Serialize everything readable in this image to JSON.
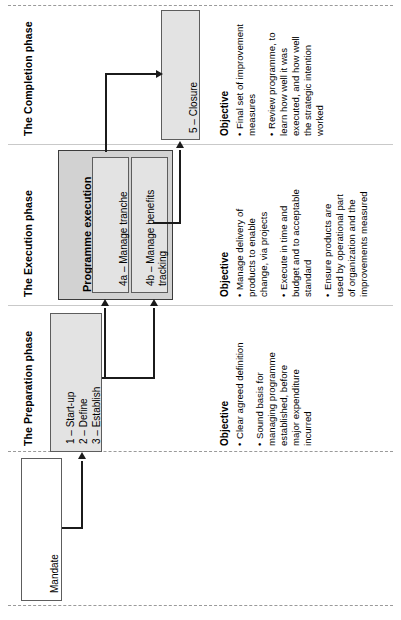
{
  "diagram": {
    "orientation": "rotated-90-ccw",
    "colors": {
      "box_fill_light": "#e3e3e3",
      "box_fill_dark": "#d2d2d2",
      "box_border": "#5d5d5d",
      "line": "#1b1b1b",
      "divider": "#9a9a9a",
      "background": "#ffffff"
    }
  },
  "phases": {
    "completion": {
      "label": "The Completion phase",
      "objective_title": "Objective",
      "objective_items": [
        "Final set of improvement measures",
        "Review programme, to learn how well it was executed, and how well the strategic intention worked"
      ],
      "objective_items_lines": [
        [
          "Final set of improvement",
          "measures"
        ],
        [
          "Review programme, to",
          "learn how well it was",
          "executed, and how well",
          "the strategic intention",
          "worked"
        ]
      ]
    },
    "execution": {
      "label": "The Execution phase",
      "objective_title": "Objective",
      "objective_items": [
        "Manage delivery of products to enable change, via projects",
        "Execute in time and budget and to acceptable standard",
        "Ensure products are used by operational part of organization and the improvements measured"
      ],
      "objective_items_lines": [
        [
          "Manage delivery of",
          "products to enable",
          "change, via projects"
        ],
        [
          "Execute in time and",
          "budget and to acceptable",
          "standard"
        ],
        [
          "Ensure products are",
          "used by operational part",
          "of organization and the",
          "improvements measured"
        ]
      ]
    },
    "preparation": {
      "label": "The Preparation phase",
      "objective_title": "Objective",
      "objective_items": [
        "Clear agreed definition",
        "Sound basis for managing programme established, before major expenditure incurred"
      ],
      "objective_items_lines": [
        [
          "Clear agreed definition"
        ],
        [
          "Sound basis for",
          "managing programme",
          "established, before",
          "major expenditure",
          "incurred"
        ]
      ]
    }
  },
  "boxes": {
    "mandate": {
      "label": "Mandate"
    },
    "preparation_steps": {
      "lines": [
        "1 – Start-up",
        "2 – Define",
        "3 – Establish"
      ]
    },
    "programme_execution": {
      "title": "Programme execution",
      "children": [
        {
          "label": "4a – Manage tranche",
          "lines": [
            "4a – Manage tranche"
          ]
        },
        {
          "label": "4b – Manage benefits tracking",
          "lines": [
            "4b – Manage benefits",
            "tracking"
          ]
        }
      ]
    },
    "closure": {
      "label": "5 – Closure"
    }
  }
}
